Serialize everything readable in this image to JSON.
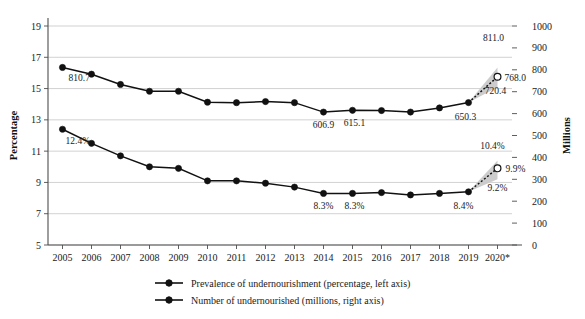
{
  "chart_data": {
    "type": "line",
    "title": "",
    "xlabel": "",
    "ylabel": "Percentage",
    "y2label": "Millions",
    "grid": true,
    "legend_position": "bottom",
    "categories": [
      "2005",
      "2006",
      "2007",
      "2008",
      "2009",
      "2010",
      "2011",
      "2012",
      "2013",
      "2014",
      "2015",
      "2016",
      "2017",
      "2018",
      "2019",
      "2020*"
    ],
    "ylim": [
      5,
      19
    ],
    "yticks": [
      5,
      7,
      9,
      11,
      13,
      15,
      17,
      19
    ],
    "y2lim": [
      0,
      1000
    ],
    "y2ticks": [
      0,
      100,
      200,
      300,
      400,
      500,
      600,
      700,
      800,
      900,
      1000
    ],
    "series": [
      {
        "name": "Number of undernourished (millions, right axis)",
        "axis": "right",
        "units": "millions",
        "values": [
          810.7,
          780.0,
          733.0,
          702.0,
          702.0,
          652.0,
          650.0,
          655.0,
          650.0,
          606.9,
          615.1,
          614.0,
          607.0,
          626.0,
          650.3,
          768.0
        ],
        "projection": {
          "year": "2020*",
          "central": 768.0,
          "low": 720.4,
          "high": 811.0
        },
        "point_labels": [
          {
            "category": "2005",
            "text": "810.7"
          },
          {
            "category": "2014",
            "text": "606.9"
          },
          {
            "category": "2015",
            "text": "615.1"
          },
          {
            "category": "2019",
            "text": "650.3"
          },
          {
            "category": "2020*",
            "text": "768.0"
          },
          {
            "category": "2020*",
            "text": "811.0"
          },
          {
            "category": "2020*",
            "text": "720.4"
          }
        ]
      },
      {
        "name": "Prevalence of undernourishment (percentage, left axis)",
        "axis": "left",
        "units": "percentage",
        "values": [
          12.4,
          11.5,
          10.7,
          10.0,
          9.9,
          9.1,
          9.1,
          8.95,
          8.7,
          8.3,
          8.3,
          8.35,
          8.2,
          8.3,
          8.4,
          9.9
        ],
        "projection": {
          "year": "2020*",
          "central": 9.9,
          "low": 9.2,
          "high": 10.4
        },
        "point_labels": [
          {
            "category": "2005",
            "text": "12.4%"
          },
          {
            "category": "2014",
            "text": "8.3%"
          },
          {
            "category": "2015",
            "text": "8.3%"
          },
          {
            "category": "2019",
            "text": "8.4%"
          },
          {
            "category": "2020*",
            "text": "9.9%"
          },
          {
            "category": "2020*",
            "text": "10.4%"
          },
          {
            "category": "2020*",
            "text": "9.2%"
          }
        ]
      }
    ],
    "legend": [
      {
        "label": "Prevalence of undernourishment (percentage, left axis)",
        "marker": "line-circle",
        "color": "#111111"
      },
      {
        "label": "Number of undernourished (millions, right axis)",
        "marker": "line-circle",
        "color": "#111111"
      }
    ],
    "colors": {
      "series_line": "#111111",
      "grid": "#bdbdbd",
      "axis": "#4d4d4d",
      "projection_band": "#c9c9c9",
      "text": "#1a1a1a",
      "background": "#ffffff"
    },
    "annotations": {
      "footnote_marker": "*",
      "projection_note": "2020 values shown as projected range"
    }
  }
}
